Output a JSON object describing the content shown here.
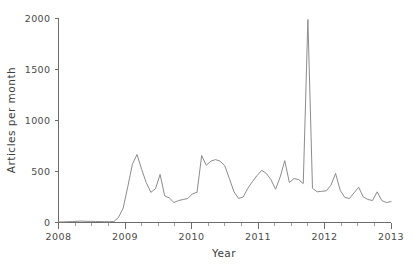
{
  "chart_data": {
    "type": "line",
    "title": "",
    "subtitle": "",
    "xlabel": "Year",
    "ylabel": "Articles per month",
    "xlim": [
      2008.0,
      2013.0
    ],
    "ylim": [
      0,
      2000
    ],
    "grid": false,
    "legend": null,
    "line_color": "#8c8c8c",
    "axis_color": "#6b6b6b",
    "x_ticks_major": [
      2008,
      2009,
      2010,
      2011,
      2012,
      2013
    ],
    "x_tick_labels": [
      "2008",
      "2009",
      "2010",
      "2011",
      "2012",
      "2013"
    ],
    "x_minor_tick_interval": 0.25,
    "y_ticks": [
      0,
      500,
      1000,
      1500,
      2000
    ],
    "y_tick_labels": [
      "0",
      "500",
      "1000",
      "1500",
      "2000"
    ],
    "x_unit": "decimal year (monthly samples)",
    "y_unit": "articles per month",
    "x": [
      2008.0,
      2008.083,
      2008.167,
      2008.25,
      2008.333,
      2008.417,
      2008.5,
      2008.583,
      2008.667,
      2008.75,
      2008.833,
      2008.917,
      2009.0,
      2009.083,
      2009.167,
      2009.25,
      2009.333,
      2009.417,
      2009.5,
      2009.583,
      2009.667,
      2009.75,
      2009.833,
      2009.917,
      2010.0,
      2010.083,
      2010.167,
      2010.25,
      2010.333,
      2010.417,
      2010.5,
      2010.583,
      2010.667,
      2010.75,
      2010.833,
      2010.917,
      2011.0,
      2011.083,
      2011.167,
      2011.25,
      2011.333,
      2011.417,
      2011.5,
      2011.583,
      2011.667,
      2011.75,
      2011.833,
      2011.917,
      2012.0,
      2012.083,
      2012.167,
      2012.25,
      2012.333,
      2012.417,
      2012.5,
      2012.583,
      2012.667,
      2012.75,
      2012.833,
      2012.917,
      2013.0
    ],
    "values": [
      5,
      6,
      8,
      10,
      14,
      12,
      11,
      10,
      9,
      8,
      8,
      10,
      45,
      130,
      330,
      560,
      665,
      520,
      390,
      300,
      325,
      240,
      195,
      215,
      225,
      230,
      275,
      290,
      650,
      560,
      600,
      615,
      560,
      430,
      300,
      235,
      250,
      330,
      400,
      455,
      510,
      480,
      420,
      325,
      440,
      605,
      390,
      430,
      415,
      385,
      1985,
      330,
      300,
      310,
      360,
      480,
      315,
      245,
      230,
      290,
      345
    ],
    "series_name": "Articles per month",
    "annotations": [
      {
        "label": "peak",
        "x": 2011.417,
        "y": 1985
      }
    ],
    "extra_points": [
      {
        "x": 2009.45,
        "y": 470
      },
      {
        "x": 2009.62,
        "y": 255
      },
      {
        "x": 2011.46,
        "y": 340
      },
      {
        "x": 2011.5,
        "y": 300
      },
      {
        "x": 2012.95,
        "y": 200
      }
    ],
    "series_detailed": [
      5,
      6,
      8,
      9,
      12,
      14,
      12,
      11,
      10,
      9,
      8,
      8,
      10,
      50,
      140,
      350,
      570,
      665,
      520,
      390,
      295,
      330,
      470,
      260,
      240,
      195,
      215,
      225,
      235,
      280,
      295,
      655,
      560,
      600,
      615,
      600,
      555,
      430,
      300,
      235,
      250,
      335,
      400,
      460,
      510,
      480,
      420,
      325,
      445,
      605,
      390,
      430,
      420,
      380,
      1985,
      335,
      300,
      305,
      310,
      365,
      480,
      315,
      245,
      235,
      290,
      345,
      250,
      225,
      215,
      300,
      215,
      195,
      205
    ]
  },
  "figure": {
    "width": 413,
    "height": 270,
    "background": "#ffffff"
  }
}
